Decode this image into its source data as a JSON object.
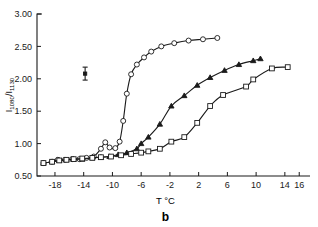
{
  "figure": {
    "panel_letter": "b",
    "background_color": "#ffffff",
    "ink_color": "#1a1a1a"
  },
  "chart_data": {
    "type": "line",
    "title": "",
    "subtitle": "",
    "xlabel": "T °C",
    "ylabel": "I_1080/I_1130",
    "ylabel_main": "I",
    "ylabel_sub1": "1080",
    "ylabel_slash": "/I",
    "ylabel_sub2": "1130",
    "xlim": [
      -20.5,
      17.5
    ],
    "ylim": [
      0.5,
      3.0
    ],
    "grid": false,
    "legend": "none",
    "xticks": [
      -18,
      -14,
      -10,
      -6,
      -2,
      2,
      6,
      10,
      14,
      16
    ],
    "xtick_labels": [
      "-18",
      "-14",
      "-10",
      "-6",
      "-2",
      "2",
      "6",
      "10",
      "14",
      "16"
    ],
    "yticks": [
      0.5,
      1.0,
      1.5,
      2.0,
      2.5,
      3.0
    ],
    "ytick_labels": [
      "0.50",
      "1.00",
      "1.50",
      "2.00",
      "2.50",
      "3.00"
    ],
    "annotations": [
      {
        "name": "error-bar",
        "x": -13.8,
        "y": 2.08,
        "half_height": 0.1,
        "cap_half_width": 0.35
      }
    ],
    "series": [
      {
        "name": "upper-sigmoid",
        "marker": "open-circle",
        "x": [
          -19.6,
          -18.4,
          -17.6,
          -16.6,
          -15.6,
          -14.6,
          -13.6,
          -12.6,
          -11.6,
          -11.0,
          -10.4,
          -9.6,
          -9.0,
          -8.5,
          -8.0,
          -7.4,
          -6.6,
          -5.6,
          -4.6,
          -3.2,
          -1.4,
          0.6,
          2.6,
          4.6
        ],
        "y": [
          0.7,
          0.72,
          0.75,
          0.75,
          0.76,
          0.76,
          0.78,
          0.8,
          0.92,
          1.02,
          0.94,
          0.93,
          1.03,
          1.35,
          1.77,
          2.07,
          2.22,
          2.33,
          2.42,
          2.5,
          2.55,
          2.59,
          2.61,
          2.63
        ]
      },
      {
        "name": "middle-sigmoid",
        "marker": "filled-triangle",
        "x": [
          -19.6,
          -18.4,
          -17.4,
          -16.4,
          -15.4,
          -14.2,
          -12.8,
          -11.6,
          -10.4,
          -9.2,
          -8.0,
          -6.6,
          -6.0,
          -5.0,
          -3.4,
          -1.8,
          0.0,
          1.8,
          3.6,
          5.6,
          7.6,
          9.6,
          10.6
        ],
        "y": [
          0.7,
          0.72,
          0.74,
          0.75,
          0.76,
          0.76,
          0.78,
          0.79,
          0.8,
          0.83,
          0.86,
          0.92,
          1.0,
          1.1,
          1.3,
          1.58,
          1.74,
          1.9,
          2.02,
          2.13,
          2.22,
          2.28,
          2.31
        ]
      },
      {
        "name": "lower-sigmoid",
        "marker": "open-square",
        "x": [
          -19.6,
          -18.4,
          -17.4,
          -16.4,
          -15.4,
          -14.2,
          -12.8,
          -11.6,
          -10.2,
          -8.8,
          -7.4,
          -6.0,
          -5.0,
          -3.4,
          -1.8,
          0.0,
          1.8,
          3.6,
          5.4,
          8.6,
          9.6,
          12.2,
          14.4
        ],
        "y": [
          0.7,
          0.72,
          0.74,
          0.75,
          0.76,
          0.77,
          0.78,
          0.79,
          0.8,
          0.82,
          0.84,
          0.86,
          0.88,
          0.92,
          1.03,
          1.1,
          1.32,
          1.58,
          1.75,
          1.88,
          1.99,
          2.16,
          2.18
        ]
      }
    ]
  }
}
